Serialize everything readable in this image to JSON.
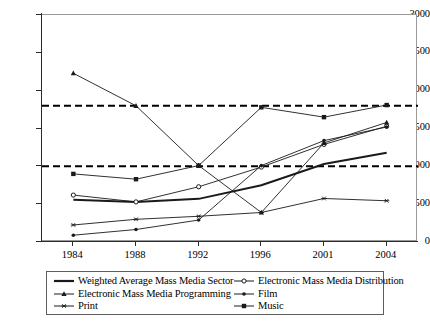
{
  "chart_data": {
    "type": "line",
    "title": "",
    "xlabel": "",
    "ylabel": "",
    "categories": [
      "1984",
      "1988",
      "1992",
      "1996",
      "2001",
      "2004"
    ],
    "ylim": [
      0,
      3000
    ],
    "yticks": [
      0,
      500,
      1000,
      1500,
      2000,
      2500,
      3000
    ],
    "ytick_labels": [
      "0",
      "500",
      "1000",
      "1500",
      "2000",
      "2500",
      "3000"
    ],
    "grid": false,
    "legend_position": "bottom",
    "reference_lines": [
      {
        "name": "lower-threshold",
        "value": 1000,
        "style": "dashed"
      },
      {
        "name": "upper-threshold",
        "value": 1800,
        "style": "dashed"
      }
    ],
    "series": [
      {
        "name": "Weighted Average Mass Media Sector",
        "marker": "none",
        "width": 2.0,
        "values": [
          560,
          530,
          570,
          750,
          1030,
          1180
        ]
      },
      {
        "name": "Electronic Mass Media Distribution",
        "marker": "circle",
        "width": 0.9,
        "values": [
          620,
          530,
          730,
          990,
          1290,
          1530
        ]
      },
      {
        "name": "Electronic Mass Media Programming",
        "marker": "triangle",
        "width": 0.9,
        "values": [
          2230,
          1800,
          1010,
          390,
          1310,
          1580
        ]
      },
      {
        "name": "Film",
        "marker": "dot",
        "width": 0.9,
        "values": [
          90,
          165,
          290,
          1010,
          1340,
          1520
        ]
      },
      {
        "name": "Print",
        "marker": "asterisk",
        "width": 0.9,
        "values": [
          225,
          300,
          340,
          390,
          575,
          545
        ]
      },
      {
        "name": "Music",
        "marker": "square",
        "width": 0.9,
        "values": [
          900,
          830,
          1010,
          1780,
          1650,
          1810
        ]
      }
    ]
  },
  "legend": {
    "left_column": [
      {
        "label": "Weighted Average Mass Media Sector",
        "marker": "none",
        "key": "weighted-average-mass-media-sector"
      },
      {
        "label": "Electronic Mass Media Programming",
        "marker": "triangle",
        "key": "electronic-mass-media-programming"
      },
      {
        "label": "Print",
        "marker": "asterisk",
        "key": "print"
      }
    ],
    "right_column": [
      {
        "label": "Electronic Mass Media Distribution",
        "marker": "circle",
        "key": "electronic-mass-media-distribution"
      },
      {
        "label": "Film",
        "marker": "dot",
        "key": "film"
      },
      {
        "label": "Music",
        "marker": "square",
        "key": "music"
      }
    ]
  },
  "colors": {
    "line": "#1a1a1a",
    "axis": "#2b2b2b",
    "frame": "#9a9a9a",
    "background": "#ffffff",
    "reference": "#000000"
  }
}
